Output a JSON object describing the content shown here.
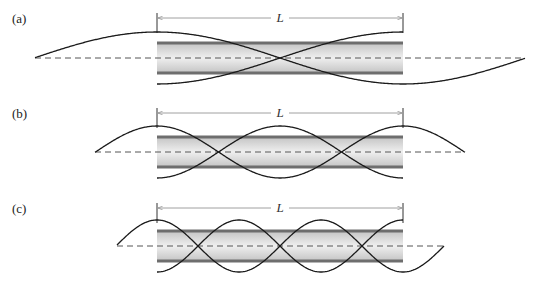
{
  "figure": {
    "panels": [
      {
        "id": "a",
        "label": "(a)",
        "dimension_label": "L",
        "label_pos": [
          12,
          11
        ],
        "dim_y": 18,
        "tube_center_y": 58,
        "axis_x": [
          35,
          525
        ],
        "quarter_wavelength": 123,
        "harmonic": 1
      },
      {
        "id": "b",
        "label": "(b)",
        "dimension_label": "L",
        "label_pos": [
          12,
          106
        ],
        "dim_y": 113,
        "tube_center_y": 152,
        "axis_x": [
          95,
          465
        ],
        "quarter_wavelength": 61.5,
        "harmonic": 2
      },
      {
        "id": "c",
        "label": "(c)",
        "dimension_label": "L",
        "label_pos": [
          12,
          201
        ],
        "dim_y": 208,
        "tube_center_y": 246,
        "axis_x": [
          117,
          444
        ],
        "quarter_wavelength": 41,
        "harmonic": 3
      }
    ],
    "tube": {
      "x_start": 157,
      "x_end": 403,
      "half_height": 15,
      "amplitude": 26
    },
    "colors": {
      "curve": "#1a1a1a",
      "tube_wall": "#6e6e6e",
      "tube_fill_edge": "#c8c8c8",
      "tube_fill_center": "#ececec",
      "dashed_axis": "#555555",
      "dimension_line": "#888888"
    }
  }
}
